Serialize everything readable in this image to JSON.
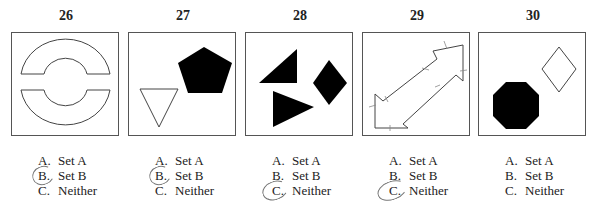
{
  "items": [
    {
      "number": "26",
      "options": [
        {
          "letter": "A.",
          "label": "Set A"
        },
        {
          "letter": "B.",
          "label": "Set B"
        },
        {
          "letter": "C.",
          "label": "Neither"
        }
      ],
      "circled": "B"
    },
    {
      "number": "27",
      "options": [
        {
          "letter": "A.",
          "label": "Set A"
        },
        {
          "letter": "B.",
          "label": "Set B"
        },
        {
          "letter": "C.",
          "label": "Neither"
        }
      ],
      "circled": "B"
    },
    {
      "number": "28",
      "options": [
        {
          "letter": "A.",
          "label": "Set A"
        },
        {
          "letter": "B.",
          "label": "Set B"
        },
        {
          "letter": "C.",
          "label": "Neither"
        }
      ],
      "circled": "C"
    },
    {
      "number": "29",
      "options": [
        {
          "letter": "A.",
          "label": "Set A"
        },
        {
          "letter": "B.",
          "label": "Set B"
        },
        {
          "letter": "C.",
          "label": "Neither"
        }
      ],
      "circled": "C"
    },
    {
      "number": "30",
      "options": [
        {
          "letter": "A.",
          "label": "Set A"
        },
        {
          "letter": "B.",
          "label": "Set B"
        },
        {
          "letter": "C.",
          "label": "Neither"
        }
      ],
      "circled": null
    }
  ]
}
